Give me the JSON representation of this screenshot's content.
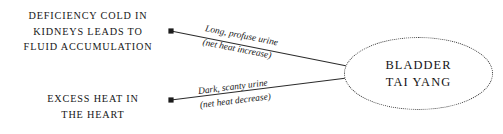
{
  "diagram": {
    "background_color": "#ffffff",
    "line_color": "#2b2b2b",
    "node_border_color": "#3a3a3a",
    "text_color": "#161616",
    "sources": [
      {
        "id": "kidneys",
        "lines": [
          "DEFICIENCY COLD IN",
          "KIDNEYS LEADS TO",
          "FLUID ACCUMULATION"
        ]
      },
      {
        "id": "heart",
        "lines": [
          "EXCESS HEAT IN",
          "THE HEART"
        ]
      }
    ],
    "edges": [
      {
        "id": "upper",
        "from": "kidneys",
        "to": "bladder",
        "label": "Long, profuse urine",
        "sublabel": "(net heat increase)",
        "start": {
          "x": 171,
          "y": 31
        },
        "end": {
          "x": 347,
          "y": 66
        }
      },
      {
        "id": "lower",
        "from": "heart",
        "to": "bladder",
        "label": "Dark, scanty urine",
        "sublabel": "(net heat decrease)",
        "start": {
          "x": 171,
          "y": 100
        },
        "end": {
          "x": 347,
          "y": 78
        }
      }
    ],
    "target_node": {
      "id": "bladder",
      "shape": "ellipse",
      "border_style": "dotted",
      "lines": [
        "BLADDER",
        "TAI YANG"
      ]
    }
  }
}
